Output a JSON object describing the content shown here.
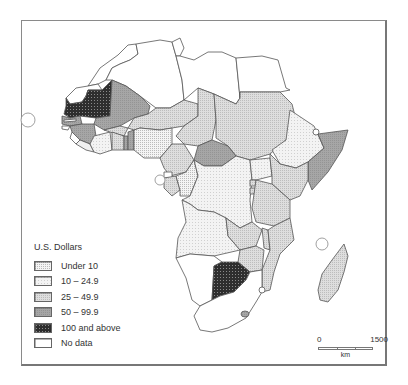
{
  "legend": {
    "title": "U.S. Dollars",
    "items": [
      {
        "label": "Under 10",
        "pattern": "fine-dots"
      },
      {
        "label": "10 – 24.9",
        "pattern": "light-stipple"
      },
      {
        "label": "25 – 49.9",
        "pattern": "light-grid"
      },
      {
        "label": "50 – 99.9",
        "pattern": "medium-gray"
      },
      {
        "label": "100 and above",
        "pattern": "dark-grid"
      },
      {
        "label": "No data",
        "pattern": "blank"
      }
    ]
  },
  "scale": {
    "min_label": "0",
    "max_label": "1500",
    "unit": "km"
  },
  "colors": {
    "under_10": "#eeeeee",
    "10_24": "#f2f2f2",
    "25_49": "#d6d6d6",
    "50_99": "#a2a2a2",
    "100_up": "#3a3a3a",
    "no_data": "#ffffff",
    "border": "#555555"
  }
}
